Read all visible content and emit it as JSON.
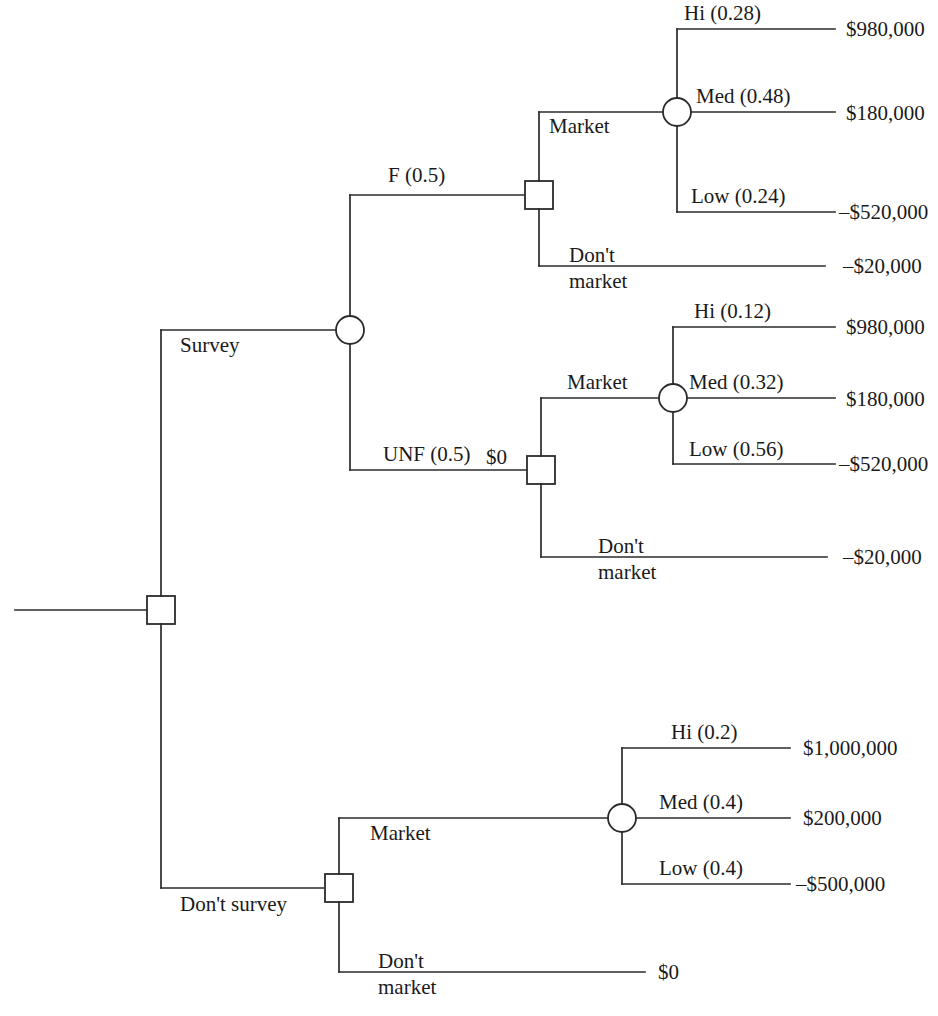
{
  "diagram": {
    "type": "decision-tree",
    "title": "",
    "root": {
      "node_type": "decision",
      "options": [
        "Survey",
        "Don't survey"
      ]
    },
    "labels": {
      "survey": "Survey",
      "dont_survey": "Don't survey",
      "favorable": "F (0.5)",
      "unfavorable": "UNF (0.5)",
      "survey_cost": "$0",
      "market_top": "Market",
      "dont_market_top_line1": "Don't",
      "dont_market_top_line2": "market",
      "market_mid": "Market",
      "dont_market_mid_line1": "Don't",
      "dont_market_mid_line2": "market",
      "market_bottom": "Market",
      "dont_market_bottom_line1": "Don't",
      "dont_market_bottom_line2": "market"
    },
    "branches": {
      "favorable_market": {
        "outcomes": [
          {
            "name": "Hi (0.28)",
            "payoff": "$980,000"
          },
          {
            "name": "Med (0.48)",
            "payoff": "$180,000"
          },
          {
            "name": "Low (0.24)",
            "payoff": "–$520,000"
          }
        ],
        "dont_market_payoff": "–$20,000"
      },
      "unfavorable_market": {
        "outcomes": [
          {
            "name": "Hi (0.12)",
            "payoff": "$980,000"
          },
          {
            "name": "Med (0.32)",
            "payoff": "$180,000"
          },
          {
            "name": "Low (0.56)",
            "payoff": "–$520,000"
          }
        ],
        "dont_market_payoff": "–$20,000"
      },
      "no_survey_market": {
        "outcomes": [
          {
            "name": "Hi (0.2)",
            "payoff": "$1,000,000"
          },
          {
            "name": "Med (0.4)",
            "payoff": "$200,000"
          },
          {
            "name": "Low (0.4)",
            "payoff": "–$500,000"
          }
        ],
        "dont_market_payoff": "$0"
      }
    },
    "colors": {
      "line": "#2b2b2b",
      "text": "#1a1a1a",
      "background": "#ffffff"
    }
  }
}
